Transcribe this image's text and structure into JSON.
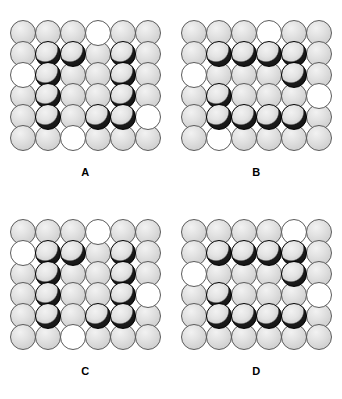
{
  "figure": {
    "legend": {
      "grey": "grey-atom",
      "white": "white-atom",
      "black": "black-atom"
    },
    "colors": {
      "grey_fill": "#e2e2e2",
      "white_fill": "#ffffff",
      "black_fill": "#111111",
      "outline": "#5b5b5b",
      "background": "#ffffff",
      "label_text": "#000000"
    },
    "grid_rows": 6,
    "grid_cols": 6,
    "panels": [
      {
        "label": "A",
        "cells": [
          [
            "grey",
            "grey",
            "grey",
            "white",
            "grey",
            "grey"
          ],
          [
            "grey",
            "black",
            "black",
            "grey",
            "black",
            "grey"
          ],
          [
            "white",
            "black",
            "grey",
            "grey",
            "black",
            "grey"
          ],
          [
            "grey",
            "black",
            "grey",
            "grey",
            "black",
            "grey"
          ],
          [
            "grey",
            "black",
            "grey",
            "black",
            "black",
            "white"
          ],
          [
            "grey",
            "grey",
            "white",
            "grey",
            "grey",
            "grey"
          ]
        ]
      },
      {
        "label": "B",
        "cells": [
          [
            "grey",
            "grey",
            "grey",
            "white",
            "grey",
            "grey"
          ],
          [
            "grey",
            "black",
            "black",
            "black",
            "black",
            "grey"
          ],
          [
            "white",
            "grey",
            "grey",
            "grey",
            "black",
            "grey"
          ],
          [
            "grey",
            "black",
            "grey",
            "grey",
            "grey",
            "white"
          ],
          [
            "grey",
            "black",
            "black",
            "black",
            "black",
            "grey"
          ],
          [
            "grey",
            "white",
            "grey",
            "grey",
            "grey",
            "grey"
          ]
        ]
      },
      {
        "label": "C",
        "cells": [
          [
            "grey",
            "grey",
            "grey",
            "white",
            "grey",
            "grey"
          ],
          [
            "white",
            "black",
            "black",
            "grey",
            "black",
            "grey"
          ],
          [
            "grey",
            "black",
            "grey",
            "grey",
            "black",
            "grey"
          ],
          [
            "grey",
            "black",
            "grey",
            "grey",
            "black",
            "white"
          ],
          [
            "grey",
            "black",
            "grey",
            "black",
            "black",
            "grey"
          ],
          [
            "grey",
            "grey",
            "white",
            "grey",
            "grey",
            "grey"
          ]
        ]
      },
      {
        "label": "D",
        "cells": [
          [
            "grey",
            "grey",
            "grey",
            "grey",
            "white",
            "grey"
          ],
          [
            "grey",
            "black",
            "black",
            "black",
            "black",
            "grey"
          ],
          [
            "white",
            "grey",
            "grey",
            "grey",
            "black",
            "grey"
          ],
          [
            "grey",
            "black",
            "grey",
            "grey",
            "grey",
            "white"
          ],
          [
            "grey",
            "black",
            "black",
            "black",
            "black",
            "grey"
          ],
          [
            "grey",
            "grey",
            "grey",
            "grey",
            "grey",
            "grey"
          ]
        ]
      }
    ]
  }
}
